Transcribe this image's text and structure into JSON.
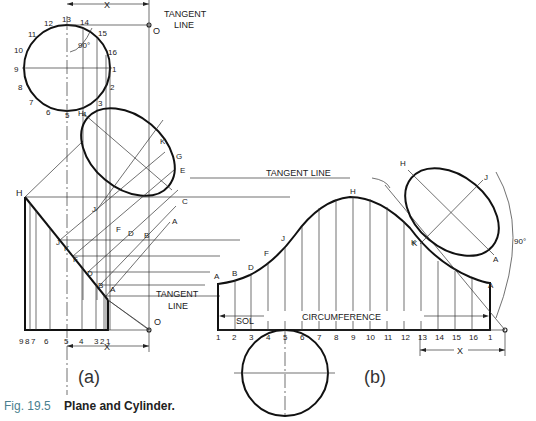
{
  "figure": {
    "number": "Fig. 19.5",
    "title": "Plane and Cylinder."
  },
  "view_a": {
    "label": "(a)",
    "tangent_line_top": [
      "TANGENT",
      "LINE"
    ],
    "tangent_line_bottom": [
      "TANGENT",
      "LINE"
    ],
    "point_O": "O",
    "dimension_x": "X",
    "angle": "90°",
    "circle_points": [
      "1",
      "2",
      "3",
      "4",
      "5",
      "6",
      "7",
      "8",
      "9",
      "10",
      "11",
      "12",
      "13",
      "14",
      "15",
      "16"
    ],
    "ellipse_points": [
      "H",
      "K",
      "G",
      "E",
      "C",
      "A",
      "B",
      "D",
      "F",
      "J"
    ],
    "edge_points": [
      "H",
      "J",
      "K",
      "F",
      "D",
      "B",
      "A"
    ],
    "base_numbers": [
      "9",
      "8",
      "7",
      "6",
      "5",
      "4",
      "3",
      "2",
      "1"
    ]
  },
  "view_b": {
    "label": "(b)",
    "tangent_line": "TANGENT LINE",
    "curve_points": [
      "A",
      "B",
      "D",
      "F",
      "J",
      "H",
      "K",
      "A"
    ],
    "ellipse_points": [
      "H",
      "J",
      "K",
      "A"
    ],
    "angle": "90°",
    "sol_label": "SOL",
    "circumference_label": "CIRCUMFERENCE",
    "dimension_x": "X",
    "base_numbers": [
      "1",
      "2",
      "3",
      "4",
      "5",
      "6",
      "7",
      "8",
      "9",
      "10",
      "11",
      "12",
      "13",
      "14",
      "15",
      "16",
      "1"
    ]
  }
}
